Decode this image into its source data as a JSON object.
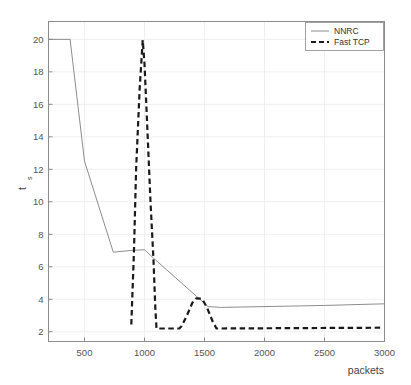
{
  "chart_data": {
    "type": "line",
    "title": "",
    "xlabel": "packets",
    "ylabel": "t_s",
    "ylabel_base": "t",
    "ylabel_sub": "s",
    "xlim": [
      200,
      3000
    ],
    "ylim": [
      1.4,
      21.1
    ],
    "grid": true,
    "legend_position": "top-right",
    "xticks": [
      500,
      1000,
      1500,
      2000,
      2500,
      3000
    ],
    "xtick_labels": [
      "500",
      "1000",
      "1500",
      "2000",
      "2500",
      "3000"
    ],
    "yticks": [
      2,
      4,
      6,
      8,
      10,
      12,
      14,
      16,
      18,
      20
    ],
    "ytick_labels": [
      "2",
      "4",
      "6",
      "8",
      "10",
      "12",
      "14",
      "16",
      "18",
      "20"
    ],
    "series": [
      {
        "name": "NNRC",
        "style": "solid",
        "color": "#808080",
        "width": 0.9,
        "points": [
          [
            200,
            20.0
          ],
          [
            380,
            20.0
          ],
          [
            500,
            12.5
          ],
          [
            740,
            6.9
          ],
          [
            880,
            7.0
          ],
          [
            1000,
            7.05
          ],
          [
            1080,
            6.5
          ],
          [
            1530,
            3.55
          ],
          [
            1640,
            3.5
          ],
          [
            2500,
            3.62
          ],
          [
            3000,
            3.72
          ]
        ]
      },
      {
        "name": "Fast TCP",
        "style": "dashed",
        "color": "#1a1a1a",
        "width": 2.2,
        "points": [
          [
            890,
            2.45
          ],
          [
            912,
            6.9
          ],
          [
            930,
            12.0
          ],
          [
            960,
            17.0
          ],
          [
            985,
            19.95
          ],
          [
            1000,
            18.5
          ],
          [
            1015,
            16.0
          ],
          [
            1050,
            10.0
          ],
          [
            1075,
            6.4
          ],
          [
            1090,
            3.5
          ],
          [
            1100,
            2.2
          ],
          [
            1290,
            2.2
          ],
          [
            1310,
            2.35
          ],
          [
            1350,
            2.95
          ],
          [
            1400,
            3.8
          ],
          [
            1430,
            4.05
          ],
          [
            1480,
            4.03
          ],
          [
            1520,
            3.5
          ],
          [
            1570,
            2.6
          ],
          [
            1600,
            2.2
          ],
          [
            2990,
            2.25
          ]
        ]
      }
    ]
  },
  "legend": {
    "entries": [
      {
        "label": "NNRC",
        "marker": "solid-line"
      },
      {
        "label": "Fast TCP",
        "marker": "dashed-line"
      }
    ]
  },
  "colors": {
    "background": "#ffffff",
    "axis": "#8c8c8c",
    "grid": "#e8e8e8",
    "nnrc": "#808080",
    "fasttcp": "#1a1a1a",
    "text": "#555555"
  }
}
